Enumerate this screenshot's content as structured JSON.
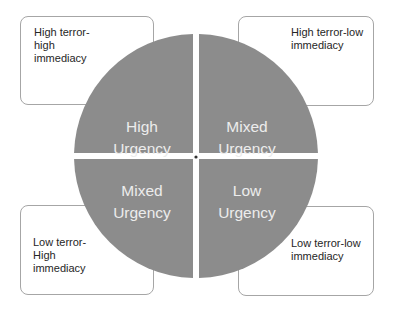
{
  "colors": {
    "quadrant_fill": "#8c8c8c",
    "quadrant_text": "#ececec",
    "box_border": "#a6a6a6",
    "box_text": "#262626"
  },
  "quadrants": [
    {
      "id": "top-left",
      "line1": "High",
      "line2": "Urgency"
    },
    {
      "id": "top-right",
      "line1": "Mixed",
      "line2": "Urgency"
    },
    {
      "id": "bottom-left",
      "line1": "Mixed",
      "line2": "Urgency"
    },
    {
      "id": "bottom-right",
      "line1": "Low",
      "line2": "Urgency"
    }
  ],
  "boxes": {
    "top_left": "High terror-\nhigh\nimmediacy",
    "top_right": "High terror-low\nimmediacy",
    "bottom_left": "Low terror-\nHigh\nimmediacy",
    "bottom_right": "Low terror-low\nimmediacy"
  }
}
